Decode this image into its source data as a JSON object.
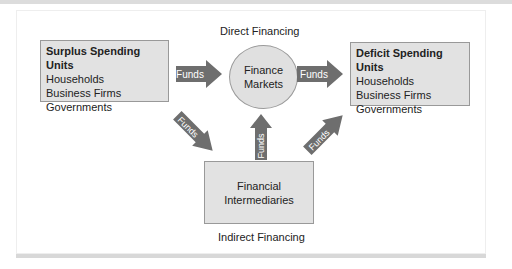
{
  "diagram": {
    "captions": {
      "direct": "Direct Financing",
      "indirect": "Indirect Financing"
    },
    "surplus": {
      "title": "Surplus Spending Units",
      "items": [
        "Households",
        "Business Firms",
        "Governments"
      ]
    },
    "deficit": {
      "title": "Deficit Spending Units",
      "items": [
        "Households",
        "Business Firms",
        "Governments"
      ]
    },
    "markets": {
      "line1": "Finance",
      "line2": "Markets"
    },
    "intermediaries": {
      "line1": "Financial",
      "line2": "Intermediaries"
    },
    "arrows": {
      "surplus_to_markets": "Funds",
      "markets_to_deficit": "Funds",
      "surplus_to_intermediaries": "Funds",
      "intermediaries_to_markets": "Funds",
      "intermediaries_to_deficit": "Funds"
    },
    "colors": {
      "arrow": "#6e6e6e",
      "box_fill": "#e2e2e2",
      "border": "#999999"
    }
  }
}
